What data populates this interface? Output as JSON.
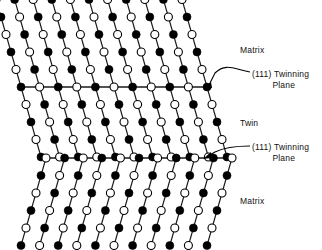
{
  "figure": {
    "type": "crystal-lattice-twinning-diagram"
  },
  "labels": {
    "matrix_top": "Matrix",
    "twin": "Twin",
    "matrix_bottom": "Matrix",
    "plane_top_line1": "(111) Twinning",
    "plane_top_line2": "Plane",
    "plane_bottom_line1": "(111) Twinning",
    "plane_bottom_line2": "Plane"
  },
  "colors": {
    "filled_atom": "#000000",
    "open_atom": "#ffffff",
    "atom_stroke": "#000000",
    "bond": "#1a1a1a",
    "background": "#ffffff",
    "text": "#111111"
  },
  "lattice": {
    "columns": 11,
    "x_start": 21,
    "x_spacing": 18.6,
    "row_spacing": 17.5,
    "atom_radius_filled": 4.0,
    "atom_radius_open": 4.0,
    "twinning_plane_rows": [
      87,
      158
    ],
    "top_row_y": 14,
    "bottom_row_y": 232,
    "matrix_top_rows": 5,
    "twin_rows": 5,
    "matrix_bottom_rows": 5,
    "shear_matrix": 5.0,
    "shear_twin": -5.0
  },
  "chart_data": {
    "type": "scatter",
    "title": "",
    "xlabel": "",
    "ylabel": "",
    "regions": [
      {
        "name": "Matrix",
        "position": "top",
        "bond_direction": "down-right"
      },
      {
        "name": "Twin",
        "position": "middle",
        "bond_direction": "down-left"
      },
      {
        "name": "Matrix",
        "position": "bottom",
        "bond_direction": "down-right"
      }
    ],
    "boundaries": [
      {
        "name": "(111) Twinning Plane",
        "y": 87
      },
      {
        "name": "(111) Twinning Plane",
        "y": 158
      }
    ],
    "atom_types": [
      "filled",
      "open"
    ],
    "legend": []
  }
}
